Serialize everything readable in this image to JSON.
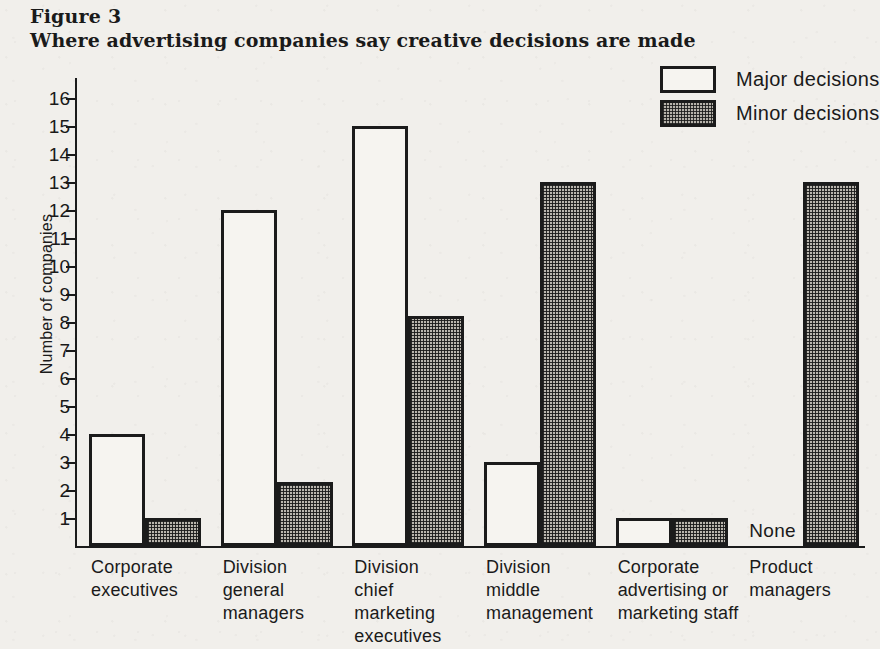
{
  "figure": {
    "number": "Figure 3",
    "title": "Where advertising companies say creative decisions are made"
  },
  "legend": {
    "items": [
      {
        "label": "Major decisions",
        "swatch": "outline-white"
      },
      {
        "label": "Minor decisions",
        "swatch": "dotted-gray"
      }
    ]
  },
  "annotations": {
    "none_label": "None"
  },
  "chart_data": {
    "type": "bar",
    "title": "Where advertising companies say creative decisions are made",
    "subtitle": "Figure 3",
    "xlabel": "",
    "ylabel": "Number of companies",
    "ylim": [
      0,
      16.5
    ],
    "yticks": [
      1,
      2,
      3,
      4,
      5,
      6,
      7,
      8,
      9,
      10,
      11,
      12,
      13,
      14,
      15,
      16
    ],
    "ytick_labels": [
      "1",
      "2",
      "3",
      "4",
      "5",
      "6",
      "7",
      "8",
      "9",
      "10",
      "11",
      "12",
      "13",
      "14",
      "15",
      "16"
    ],
    "grid": false,
    "legend_position": "top-right",
    "categories": [
      "Corporate\nexecutives",
      "Division\ngeneral\nmanagers",
      "Division\nchief\nmarketing\nexecutives",
      "Division\nmiddle\nmanagement",
      "Corporate\nadvertising or\nmarketing staff",
      "Product\nmanagers"
    ],
    "series": [
      {
        "name": "Major decisions",
        "color": "#f6f4f0",
        "values": [
          4,
          12,
          15,
          3,
          1,
          0
        ],
        "value_labels": [
          "4",
          "12",
          "15",
          "3",
          "1",
          "None"
        ]
      },
      {
        "name": "Minor decisions",
        "color": "#b9b5ad",
        "values": [
          1,
          2.3,
          8.2,
          13,
          1,
          13
        ],
        "value_labels": [
          "1",
          "2",
          "8",
          "13",
          "1",
          "13"
        ]
      }
    ]
  },
  "colors": {
    "ink": "#1b1b1b",
    "paper": "#f1efeb",
    "major_fill": "#f6f4f0",
    "minor_fill": "#b9b5ad"
  }
}
